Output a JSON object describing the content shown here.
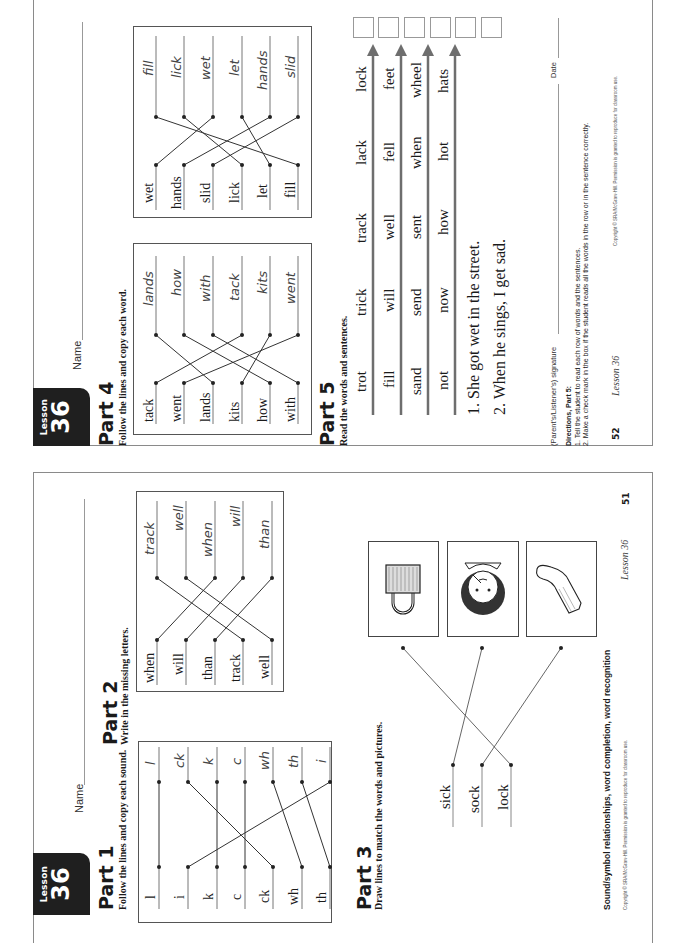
{
  "page_52": {
    "badge": {
      "label": "Lesson",
      "number": "36"
    },
    "name_label": "Name",
    "part4": {
      "title": "Part 4",
      "instruction": "Follow the lines and copy each word.",
      "left_box": {
        "left_words": [
          "tack",
          "went",
          "lands",
          "kits",
          "how",
          "with"
        ],
        "right_words": [
          "lands",
          "how",
          "with",
          "tack",
          "kits",
          "went"
        ]
      },
      "right_box": {
        "left_words": [
          "wet",
          "hands",
          "slid",
          "lick",
          "let",
          "fill"
        ],
        "right_words": [
          "fill",
          "lick",
          "wet",
          "let",
          "hands",
          "slid"
        ]
      }
    },
    "part5": {
      "title": "Part 5",
      "instruction": "Read the words and sentences.",
      "rows": [
        [
          "trot",
          "trick",
          "track",
          "lack",
          "lock"
        ],
        [
          "fill",
          "will",
          "well",
          "fell",
          "feet"
        ],
        [
          "sand",
          "send",
          "sent",
          "when",
          "wheel"
        ],
        [
          "not",
          "now",
          "how",
          "hot",
          "hats"
        ]
      ],
      "sentences": [
        "1. She got wet in the street.",
        "2. When he sings, I get sad."
      ],
      "checkbox_count": 6
    },
    "signature_label": "(Parent's/Listener's) signature",
    "date_label": "Date",
    "directions": {
      "title": "Directions, Part 5:",
      "lines": [
        "1. Tell the student to read each row of words and the sentences.",
        "2. Make a check mark in the box if the student reads all the words in the row or in the sentence correctly."
      ]
    },
    "footer": {
      "page_number": "52",
      "lesson": "Lesson 36",
      "copyright": "Copyright © SRA/McGraw-Hill. Permission is granted to reproduce for classroom use."
    }
  },
  "page_51": {
    "badge": {
      "label": "Lesson",
      "number": "36"
    },
    "name_label": "Name",
    "part1": {
      "title": "Part 1",
      "instruction": "Follow the lines and copy each sound.",
      "left_items": [
        "l",
        "i",
        "k",
        "c",
        "ck",
        "wh",
        "th"
      ],
      "right_items": [
        "l",
        "ck",
        "k",
        "c",
        "wh",
        "th",
        "i"
      ]
    },
    "part2": {
      "title": "Part 2",
      "instruction": "Write in the missing letters.",
      "left_words": [
        "when",
        "will",
        "than",
        "track",
        "well"
      ],
      "right_words": [
        "track",
        "well",
        "when",
        "will",
        "than"
      ]
    },
    "part3": {
      "title": "Part 3",
      "instruction": "Draw lines to match the words and pictures.",
      "words": [
        "sick",
        "sock",
        "lock"
      ],
      "pictures": [
        "padlock",
        "sick-child",
        "sock"
      ]
    },
    "footer": {
      "skills": "Sound/symbol relationships, word completion, word recognition",
      "copyright": "Copyright © SRA/McGraw-Hill. Permission is granted to reproduce for classroom use.",
      "lesson": "Lesson 36",
      "page_number": "51"
    }
  },
  "colors": {
    "border": "#8a8a8a",
    "badge": "#1f1f1f",
    "arrow": "#6e6e6e",
    "text": "#1a1a1a"
  }
}
